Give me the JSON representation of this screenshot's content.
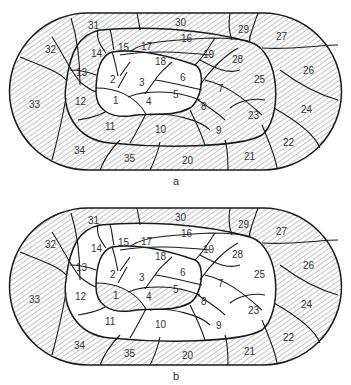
{
  "colors": {
    "line": "#1a1a1a",
    "hatch": "#555555",
    "background": "#ffffff",
    "text": "#333333"
  },
  "panels": [
    {
      "caption": "a",
      "hatched_regions": [
        "7",
        "8",
        "9",
        "10",
        "11",
        "12",
        "13",
        "14",
        "15",
        "16",
        "17",
        "18",
        "19",
        "20",
        "21",
        "22",
        "23",
        "24",
        "25",
        "26",
        "27",
        "28",
        "29",
        "30",
        "31",
        "32",
        "33",
        "34",
        "35"
      ],
      "white_regions": [
        "1",
        "2",
        "3",
        "4",
        "5",
        "6"
      ],
      "labels": [
        "1",
        "2",
        "3",
        "4",
        "5",
        "6",
        "7",
        "8",
        "9",
        "10",
        "11",
        "12",
        "13",
        "14",
        "15",
        "16",
        "17",
        "18",
        "19",
        "20",
        "21",
        "22",
        "23",
        "24",
        "25",
        "26",
        "27",
        "28",
        "29",
        "30",
        "31",
        "32",
        "33",
        "34",
        "35"
      ]
    },
    {
      "caption": "b",
      "hatched_regions": [
        "1",
        "5",
        "20",
        "21",
        "22",
        "24",
        "26",
        "27",
        "29",
        "30",
        "31",
        "32",
        "33",
        "34",
        "35"
      ],
      "white_regions": [
        "2",
        "3",
        "4",
        "6",
        "7",
        "8",
        "9",
        "10",
        "11",
        "12",
        "13",
        "14",
        "15",
        "16",
        "17",
        "18",
        "19",
        "23",
        "25",
        "28"
      ],
      "labels": [
        "1",
        "2",
        "3",
        "4",
        "5",
        "6",
        "7",
        "8",
        "9",
        "10",
        "11",
        "12",
        "13",
        "14",
        "15",
        "16",
        "17",
        "18",
        "19",
        "20",
        "21",
        "22",
        "23",
        "24",
        "25",
        "26",
        "27",
        "28",
        "29",
        "30",
        "31",
        "32",
        "33",
        "34",
        "35"
      ]
    }
  ]
}
